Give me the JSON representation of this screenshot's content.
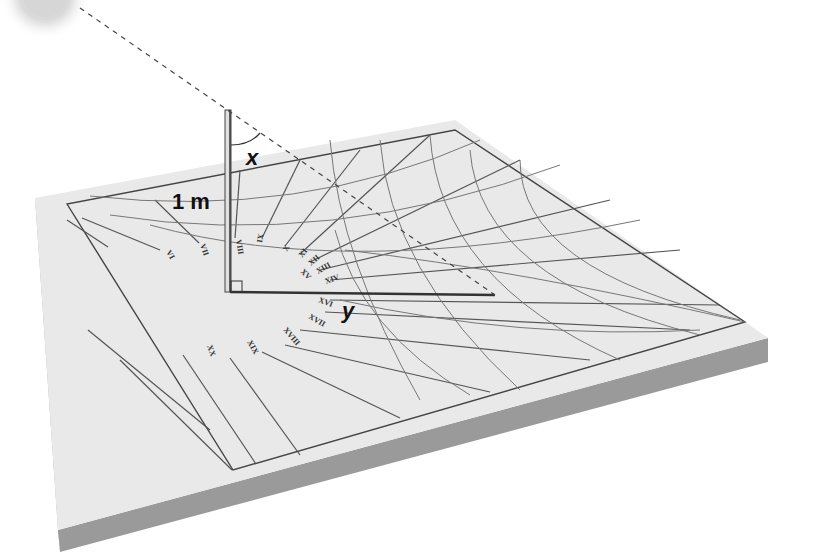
{
  "diagram": {
    "labels": {
      "gnomon_height": "1 m",
      "angle": "x",
      "shadow": "y"
    },
    "hour_marks": [
      "VI",
      "VII",
      "VIII",
      "IX",
      "X",
      "XI",
      "XII",
      "XIII",
      "XIV",
      "XV",
      "XVI",
      "XVII",
      "XVIII",
      "XIX",
      "XX"
    ],
    "colors": {
      "board_top": "#e8e8e8",
      "board_side_left": "#a9a9a9",
      "board_side_front": "#9a9a9a",
      "line": "#555555",
      "sun": "#d8d8d8"
    }
  }
}
